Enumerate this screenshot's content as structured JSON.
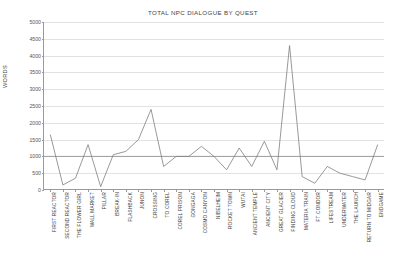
{
  "chart_data": {
    "type": "line",
    "title": "TOTAL NPC DIALOGUE BY QUEST",
    "xlabel": "",
    "ylabel": "WORDS",
    "ylim": [
      0,
      5000
    ],
    "ytick_step": 500,
    "yticks": [
      "0",
      "500",
      "1000",
      "1500",
      "2000",
      "2500",
      "3000",
      "3500",
      "4000",
      "4500",
      "5000"
    ],
    "grid": true,
    "legend": "none",
    "categories": [
      "FIRST REACTOR",
      "SECOND REACTOR",
      "THE FLOWER GIRL",
      "WALL MARKET",
      "PILLAR",
      "BREAK-IN",
      "FLASHBACK",
      "JUNON",
      "CROSSING",
      "TO COREL",
      "COREL PRISON",
      "GONGAGA",
      "COSMO CANYON",
      "NIBELHEIM",
      "ROCKET TOWN",
      "WUTAI",
      "ANCIENT TEMPLE",
      "ANCIENT CITY",
      "GREAT GLACIER",
      "FINDING CLOUD",
      "MATERIA TRAIN",
      "FT CONDOR",
      "LIFESTREAM",
      "UNDERWATER",
      "THE LAUNCH",
      "RETURN TO MIDGAR",
      "ENDGAME"
    ],
    "series": [
      {
        "name": "Words",
        "color": "#7f7f7f",
        "values": [
          1650,
          150,
          350,
          1350,
          100,
          1050,
          1150,
          1500,
          2400,
          700,
          1000,
          1000,
          1300,
          1000,
          600,
          1250,
          700,
          1450,
          600,
          4300,
          400,
          200,
          700,
          500,
          400,
          300,
          1350
        ]
      }
    ],
    "reference_line": {
      "name": "average",
      "value": 1000,
      "color": "#8a8a8a"
    }
  }
}
